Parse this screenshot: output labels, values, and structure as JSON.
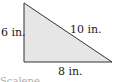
{
  "diagram": {
    "shape": "right-triangle",
    "fill_color": "#e6e6e6",
    "stroke_color": "#333333",
    "labels": {
      "left_side": "6 in.",
      "hypotenuse": "10 in.",
      "bottom_side": "8 in."
    },
    "caption": "Scalene"
  }
}
